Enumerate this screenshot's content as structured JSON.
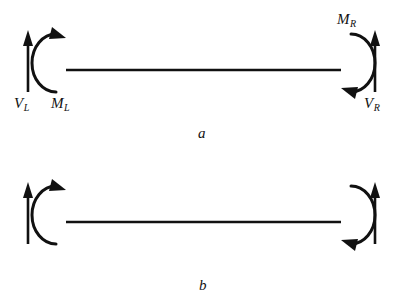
{
  "figure": {
    "background_color": "#ffffff",
    "stroke_color": "#111111",
    "panels": [
      {
        "id": "a",
        "caption": "a",
        "beam": {
          "x1": 66,
          "y1": 70,
          "x2": 341,
          "y2": 70
        },
        "labels": {
          "left_force": {
            "symbol": "V",
            "subscript": "L",
            "text": "V"
          },
          "left_moment": {
            "symbol": "M",
            "subscript": "L",
            "text": "M"
          },
          "right_moment": {
            "symbol": "M",
            "subscript": "R",
            "text": "M"
          },
          "right_force": {
            "symbol": "V",
            "subscript": "R",
            "text": "V"
          }
        },
        "arrows": [
          {
            "name": "left-shear-arrow",
            "direction": "up",
            "x": 28,
            "y_tail": 92,
            "y_head": 32
          },
          {
            "name": "right-shear-arrow",
            "direction": "up",
            "x": 375,
            "y_tail": 92,
            "y_head": 32
          }
        ],
        "moment_arcs": [
          {
            "name": "left-moment-arc",
            "opening": "right",
            "arrowhead": "top",
            "rotation": "counterclockwise"
          },
          {
            "name": "right-moment-arc",
            "opening": "left",
            "arrowhead": "bottom",
            "rotation": "counterclockwise"
          }
        ]
      },
      {
        "id": "b",
        "caption": "b",
        "beam": {
          "x1": 66,
          "y1": 70,
          "x2": 341,
          "y2": 70
        },
        "labels": {
          "left_displacement": {
            "symbol": "δ",
            "subscript": "L",
            "text": "δ"
          },
          "left_rotation": {
            "symbol": "Φ",
            "subscript": "L",
            "text": "Φ"
          },
          "right_rotation": {
            "symbol": "Φ",
            "subscript": "R",
            "text": "Φ"
          },
          "right_displacement": {
            "symbol": "δ",
            "subscript": "R",
            "text": "δ"
          }
        },
        "arrows": [
          {
            "name": "left-displacement-arrow",
            "direction": "up",
            "x": 28,
            "y_tail": 92,
            "y_head": 32
          },
          {
            "name": "right-displacement-arrow",
            "direction": "up",
            "x": 375,
            "y_tail": 92,
            "y_head": 32
          }
        ],
        "moment_arcs": [
          {
            "name": "left-rotation-arc",
            "opening": "right",
            "arrowhead": "top",
            "rotation": "counterclockwise"
          },
          {
            "name": "right-rotation-arc",
            "opening": "left",
            "arrowhead": "bottom",
            "rotation": "counterclockwise"
          }
        ]
      }
    ]
  }
}
